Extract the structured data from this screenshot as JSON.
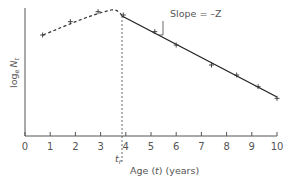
{
  "chart_data": {
    "type": "line",
    "title": "",
    "xlabel": "Age (t) (years)",
    "xlabel_parts": {
      "pre": "Age (",
      "var": "t",
      "post": ") (years)"
    },
    "ylabel": "log_e N_t",
    "ylabel_parts": {
      "log": "log",
      "sub_e": "e",
      "var": "N",
      "sub_t": "t"
    },
    "xlim": [
      0,
      10
    ],
    "x_ticks": [
      "0",
      "1",
      "2",
      "3",
      "4",
      "5",
      "6",
      "7",
      "8",
      "9",
      "10"
    ],
    "y_ticks": [],
    "grid": false,
    "legend": null,
    "recruitment_age": {
      "label": "t",
      "sub": "r",
      "x": 3.9
    },
    "annotation": {
      "text": "Slope = –Z"
    },
    "series": [
      {
        "name": "Ascending limb (not fully recruited)",
        "style": "dashed",
        "points": [
          [
            0.7,
            0.85
          ],
          [
            1.8,
            0.93
          ],
          [
            2.9,
            0.99
          ],
          [
            3.9,
            0.97
          ]
        ]
      },
      {
        "name": "Descending limb (fully recruited)",
        "style": "solid",
        "points": [
          [
            3.9,
            0.97
          ],
          [
            5.15,
            0.87
          ],
          [
            6.0,
            0.79
          ],
          [
            7.4,
            0.67
          ],
          [
            8.4,
            0.61
          ],
          [
            9.25,
            0.54
          ],
          [
            10.0,
            0.47
          ]
        ]
      }
    ]
  }
}
